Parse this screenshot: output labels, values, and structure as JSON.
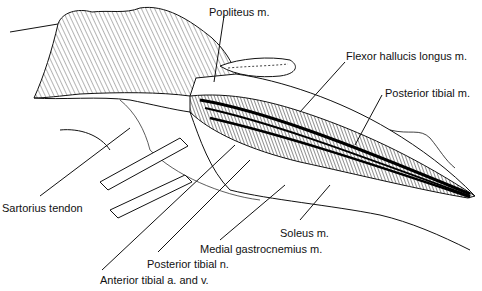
{
  "figure": {
    "type": "anatomical-illustration",
    "colors": {
      "ink": "#111111",
      "background": "#ffffff",
      "shading": "#555555"
    }
  },
  "labels": [
    {
      "id": "popliteus",
      "text": "Popliteus m.",
      "x": 209,
      "y": 6
    },
    {
      "id": "flexor-hallucis-longus",
      "text": "Flexor hallucis longus m.",
      "x": 346,
      "y": 50
    },
    {
      "id": "posterior-tibial-m",
      "text": "Posterior tibial m.",
      "x": 385,
      "y": 87
    },
    {
      "id": "sartorius-tendon",
      "text": "Sartorius tendon",
      "x": 2,
      "y": 202
    },
    {
      "id": "soleus",
      "text": "Soleus m.",
      "x": 280,
      "y": 227
    },
    {
      "id": "medial-gastrocnemius",
      "text": "Medial gastrocnemius m.",
      "x": 200,
      "y": 243
    },
    {
      "id": "posterior-tibial-n",
      "text": "Posterior tibial n.",
      "x": 147,
      "y": 258
    },
    {
      "id": "anterior-tibial-av",
      "text": "Anterior tibial a. and v.",
      "x": 100,
      "y": 274
    }
  ]
}
